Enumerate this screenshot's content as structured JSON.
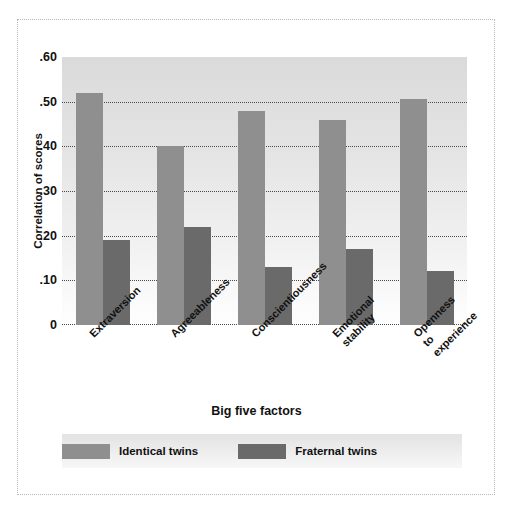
{
  "chart_data": {
    "type": "bar",
    "title": "",
    "xlabel": "Big five factors",
    "ylabel": "Correlation of scores",
    "categories": [
      "Extraversion",
      "Agreeableness",
      "Conscientiousness",
      "Emotional\nstability",
      "Openness\nto\nexperience"
    ],
    "category_lines": [
      [
        "Extraversion"
      ],
      [
        "Agreeableness"
      ],
      [
        "Conscientiousness"
      ],
      [
        "Emotional",
        "stability"
      ],
      [
        "Openness",
        "to",
        "experience"
      ]
    ],
    "series": [
      {
        "name": "Identical twins",
        "color": "#8f8f8f",
        "values": [
          0.52,
          0.4,
          0.48,
          0.46,
          0.505
        ]
      },
      {
        "name": "Fraternal twins",
        "color": "#6a6a6a",
        "values": [
          0.19,
          0.22,
          0.13,
          0.17,
          0.12
        ]
      }
    ],
    "ylim": [
      0,
      0.6
    ],
    "yticks": [
      0.6,
      0.5,
      0.4,
      0.3,
      0.2,
      0.1,
      0
    ],
    "ytick_labels": [
      ".60",
      ".50",
      ".40",
      ".30",
      ".20",
      ".10",
      "0"
    ],
    "gridlines": [
      0.5,
      0.4,
      0.3,
      0.2,
      0.1
    ],
    "grid": true,
    "legend_position": "bottom"
  },
  "axes": {
    "y_title": "Correlation of scores",
    "x_title": "Big five factors"
  },
  "legend": {
    "entries": [
      {
        "label": "Identical twins",
        "color": "#8f8f8f"
      },
      {
        "label": "Fraternal twins",
        "color": "#6a6a6a"
      }
    ]
  },
  "colors": {
    "identical": "#8f8f8f",
    "fraternal": "#6a6a6a",
    "plot_background_top": "#dadada",
    "plot_background_bottom": "#fdfdfd",
    "gridline": "#4a4a4a",
    "frame": "#b8b8b8",
    "text": "#111111"
  }
}
